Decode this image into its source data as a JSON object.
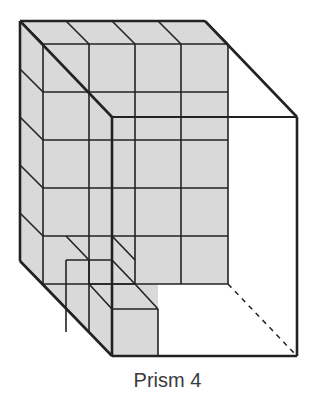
{
  "figure": {
    "caption": "Prism 4",
    "prism_dimensions_units": {
      "width": 4,
      "height": 5,
      "depth": 4
    },
    "fill_color": "#d9d9d9",
    "line_color": "#222222"
  }
}
